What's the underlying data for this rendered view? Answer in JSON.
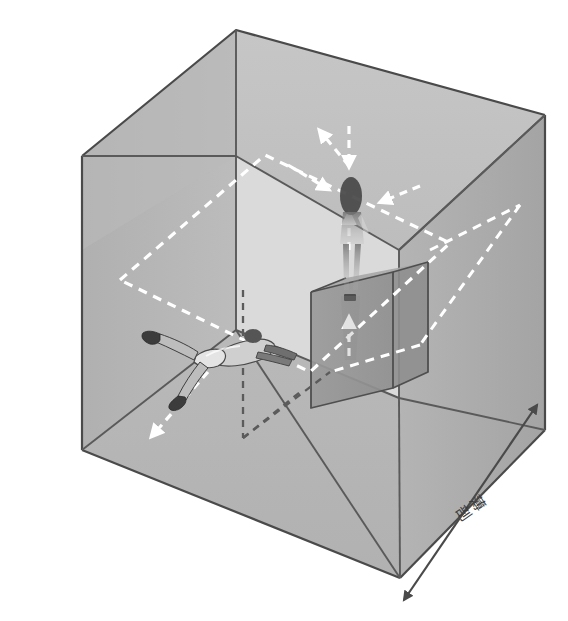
{
  "figure": {
    "background_color": "#ffffff",
    "width": 568,
    "height": 621
  },
  "palette": {
    "cube_top_face": "#bdbdbd",
    "cube_left_face": "#b2b2b2",
    "cube_right_face": "#a8a8a8",
    "cube_floor_face": "#b6b6b6",
    "cube_back_face": "#c2c2c2",
    "inner_box_face": "#9e9e9e",
    "inner_box_side": "#949494",
    "edge_stroke": "#4a4a4a",
    "inner_edge_stroke": "#5a5a5a",
    "dashed_plane_stroke": "#ffffff",
    "dashed_axis_stroke": "#5b5b5b",
    "dimension_arrow_stroke": "#4a4a4a",
    "label_text": "#3a3a3a"
  },
  "labels": {
    "depth_axis": "薄剖",
    "depth_axis_char_1": "薄",
    "depth_axis_char_2": "剖"
  },
  "annotations": {
    "dimension_arrow": {
      "name": "depth-dimension-arrow",
      "double_headed": true,
      "orientation": "bottom-right-diagonal"
    },
    "white_dashed_plane": {
      "name": "horizontal-cutting-plane",
      "style": "dashed",
      "color": "#ffffff",
      "shape": "parallelogram"
    },
    "dark_dashed_lines": {
      "name": "hidden-axis-guides",
      "style": "dashed",
      "color": "#5b5b5b"
    },
    "flow_arrows": [
      {
        "name": "arrow-down-top",
        "direction": "down"
      },
      {
        "name": "arrow-up-left",
        "direction": "up-left"
      },
      {
        "name": "arrow-right-mid",
        "direction": "right"
      },
      {
        "name": "arrow-left-right-side",
        "direction": "left"
      },
      {
        "name": "arrow-up-center",
        "direction": "up"
      },
      {
        "name": "arrow-down-left-floor",
        "direction": "down-left"
      },
      {
        "name": "arrow-up-inner-box",
        "direction": "up"
      }
    ]
  },
  "figures": [
    {
      "name": "floating-person",
      "pose": "reclining / floating horizontally",
      "opacity": "opaque",
      "position": "mid-left interior"
    },
    {
      "name": "standing-person",
      "pose": "standing upright",
      "opacity": "translucent ghost",
      "position": "on top of inner box, upper right"
    }
  ],
  "geometry": {
    "outer_cube": {
      "name": "outer-cube",
      "top_back_left": [
        82,
        156
      ],
      "top_apex": [
        236,
        30
      ],
      "top_back_right": [
        545,
        115
      ],
      "top_front": [
        399,
        250
      ],
      "bottom_left": [
        82,
        450
      ],
      "bottom_front": [
        400,
        578
      ],
      "bottom_right": [
        545,
        430
      ]
    },
    "inner_box": {
      "name": "inner-vertical-box",
      "top_left": [
        311,
        292
      ],
      "top_right": [
        393,
        272
      ],
      "bottom_left": [
        311,
        408
      ],
      "bottom_right": [
        393,
        388
      ]
    }
  }
}
